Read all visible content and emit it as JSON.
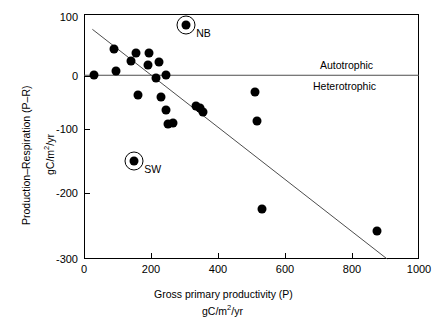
{
  "chart_data": {
    "type": "scatter",
    "title": "",
    "xlabel": "Gross primary productivity (P)",
    "xlabel_units": "gC/m2/yr",
    "ylabel": "Production–Respiration (P–R)",
    "ylabel_units": "gC/m2/yr",
    "xlim": [
      0,
      1000
    ],
    "ylim": [
      -300,
      100
    ],
    "xticks": [
      0,
      200,
      400,
      600,
      800,
      1000
    ],
    "yticks": [
      100,
      0,
      -100,
      -200,
      -300
    ],
    "grid": false,
    "legend": null,
    "annotations": [
      {
        "text": "Autotrophic",
        "x": 760,
        "y": 30,
        "note": "above the P-R = 0 line"
      },
      {
        "text": "Heterotrophic",
        "x": 760,
        "y": -28,
        "note": "below the P-R = 0 line"
      }
    ],
    "reference_lines": [
      {
        "name": "zero-line",
        "type": "horizontal",
        "y": 0,
        "x_from": 0,
        "x_to": 1000
      }
    ],
    "trend_line": {
      "name": "regression-line",
      "type": "linear",
      "x_from": 25,
      "y_from": 75,
      "x_to": 905,
      "y_to": -300
    },
    "points": [
      {
        "x": 30,
        "y": 0,
        "label": ""
      },
      {
        "x": 90,
        "y": 43,
        "label": ""
      },
      {
        "x": 95,
        "y": 7,
        "label": ""
      },
      {
        "x": 140,
        "y": 23,
        "label": ""
      },
      {
        "x": 150,
        "y": -140,
        "label": "SW",
        "highlight": true
      },
      {
        "x": 155,
        "y": 36,
        "label": ""
      },
      {
        "x": 160,
        "y": -33,
        "label": ""
      },
      {
        "x": 190,
        "y": 17,
        "label": ""
      },
      {
        "x": 195,
        "y": 36,
        "label": ""
      },
      {
        "x": 215,
        "y": -5,
        "label": ""
      },
      {
        "x": 225,
        "y": 22,
        "label": ""
      },
      {
        "x": 230,
        "y": -35,
        "label": ""
      },
      {
        "x": 245,
        "y": 1,
        "label": ""
      },
      {
        "x": 245,
        "y": -57,
        "label": ""
      },
      {
        "x": 250,
        "y": -80,
        "label": ""
      },
      {
        "x": 265,
        "y": -78,
        "label": ""
      },
      {
        "x": 305,
        "y": 82,
        "label": "NB",
        "highlight": true
      },
      {
        "x": 335,
        "y": -50,
        "label": ""
      },
      {
        "x": 345,
        "y": -54,
        "label": ""
      },
      {
        "x": 355,
        "y": -60,
        "label": ""
      },
      {
        "x": 510,
        "y": -27,
        "label": ""
      },
      {
        "x": 515,
        "y": -75,
        "label": ""
      },
      {
        "x": 530,
        "y": -218,
        "label": ""
      },
      {
        "x": 875,
        "y": -255,
        "label": ""
      }
    ]
  },
  "axes": {
    "y_tick_labels": [
      "100",
      "0",
      "-100",
      "-200",
      "-300"
    ],
    "x_tick_labels": [
      "0",
      "200",
      "400",
      "600",
      "800",
      "1000"
    ],
    "y_title_main": "Production–Respiration (P–R)",
    "y_title_units_prefix": "gC/m",
    "y_title_units_exp": "2",
    "y_title_units_suffix": "/yr",
    "x_title_main": "Gross primary productivity (P)",
    "x_title_units_prefix": "gC/m",
    "x_title_units_exp": "2",
    "x_title_units_suffix": "/yr"
  },
  "regions": {
    "above": "Autotrophic",
    "below": "Heterotrophic"
  },
  "marker_labels": {
    "nb": "NB",
    "sw": "SW"
  },
  "colors": {
    "marker": "#000000",
    "axis": "#000000",
    "line": "#4d4d4d",
    "background": "#ffffff"
  }
}
